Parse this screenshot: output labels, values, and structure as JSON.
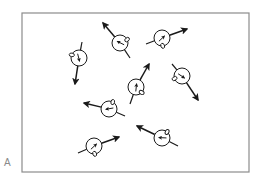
{
  "figure": {
    "panel_label": "A",
    "frame": {
      "x": 22,
      "y": 13,
      "width": 227,
      "height": 159,
      "stroke": "#8c8c8c"
    },
    "ink_color": "#1a1a1a",
    "spins": [
      {
        "id": 1,
        "cx": 79,
        "cy": 58,
        "arrow_to": [
          75,
          84
        ],
        "tail_to": [
          82,
          42
        ]
      },
      {
        "id": 2,
        "cx": 120,
        "cy": 43,
        "arrow_to": [
          103,
          23
        ],
        "tail_to": [
          130,
          58
        ]
      },
      {
        "id": 3,
        "cx": 162,
        "cy": 38,
        "arrow_to": [
          187,
          29
        ],
        "tail_to": [
          146,
          44
        ]
      },
      {
        "id": 4,
        "cx": 136,
        "cy": 87,
        "arrow_to": [
          149,
          64
        ],
        "tail_to": [
          130,
          104
        ]
      },
      {
        "id": 5,
        "cx": 182,
        "cy": 76,
        "arrow_to": [
          198,
          100
        ],
        "tail_to": [
          172,
          64
        ]
      },
      {
        "id": 6,
        "cx": 109,
        "cy": 109,
        "arrow_to": [
          84,
          103
        ],
        "tail_to": [
          125,
          116
        ]
      },
      {
        "id": 7,
        "cx": 94,
        "cy": 146,
        "arrow_to": [
          119,
          137
        ],
        "tail_to": [
          78,
          153
        ]
      },
      {
        "id": 8,
        "cx": 162,
        "cy": 138,
        "arrow_to": [
          137,
          126
        ],
        "tail_to": [
          178,
          146
        ]
      }
    ]
  }
}
